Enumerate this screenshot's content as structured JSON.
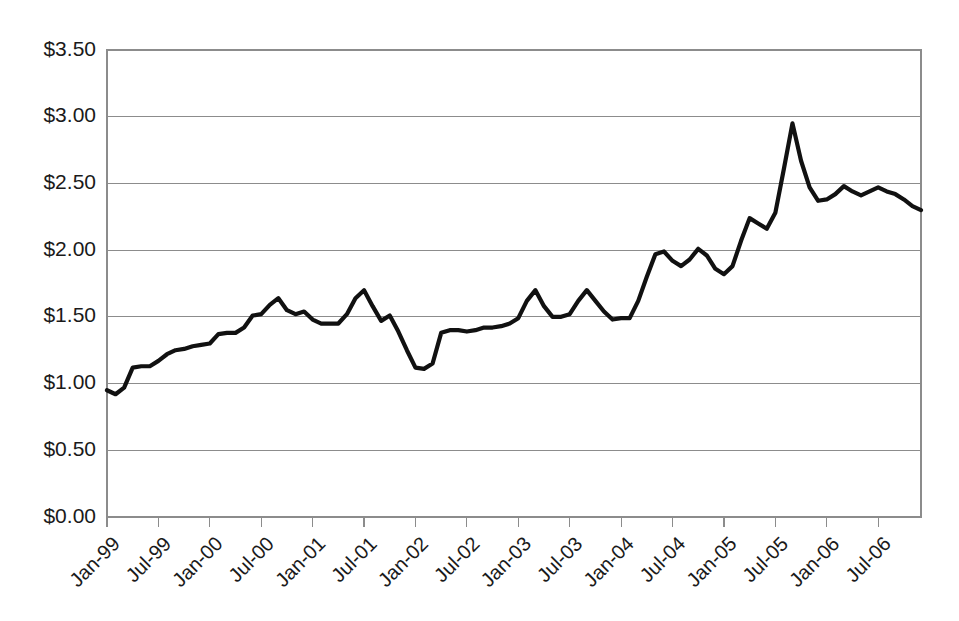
{
  "chart_data": {
    "type": "line",
    "title": "",
    "subtitle": "",
    "xlabel": "",
    "ylabel": "",
    "grid": true,
    "legend": false,
    "legend_position": "none",
    "line_color": "#111111",
    "grid_color": "#8c8c8c",
    "background_color": "#ffffff",
    "ylim": [
      0,
      3.5
    ],
    "y_tick_step": 0.5,
    "y_tick_labels": [
      "$0.00",
      "$0.50",
      "$1.00",
      "$1.50",
      "$2.00",
      "$2.50",
      "$3.00",
      "$3.50"
    ],
    "y_tick_values": [
      0,
      0.5,
      1.0,
      1.5,
      2.0,
      2.5,
      3.0,
      3.5
    ],
    "x_tick_labels": [
      "Jan-99",
      "Jul-99",
      "Jan-00",
      "Jul-00",
      "Jan-01",
      "Jul-01",
      "Jan-02",
      "Jul-02",
      "Jan-03",
      "Jul-03",
      "Jan-04",
      "Jul-04",
      "Jan-05",
      "Jul-05",
      "Jan-06",
      "Jul-06"
    ],
    "x_tick_interval_months": 6,
    "x_start": "Jan-99",
    "x_end": "Dec-06",
    "series": [
      {
        "name": "Price",
        "x": [
          "Jan-99",
          "Feb-99",
          "Mar-99",
          "Apr-99",
          "May-99",
          "Jun-99",
          "Jul-99",
          "Aug-99",
          "Sep-99",
          "Oct-99",
          "Nov-99",
          "Dec-99",
          "Jan-00",
          "Feb-00",
          "Mar-00",
          "Apr-00",
          "May-00",
          "Jun-00",
          "Jul-00",
          "Aug-00",
          "Sep-00",
          "Oct-00",
          "Nov-00",
          "Dec-00",
          "Jan-01",
          "Feb-01",
          "Mar-01",
          "Apr-01",
          "May-01",
          "Jun-01",
          "Jul-01",
          "Aug-01",
          "Sep-01",
          "Oct-01",
          "Nov-01",
          "Dec-01",
          "Jan-02",
          "Feb-02",
          "Mar-02",
          "Apr-02",
          "May-02",
          "Jun-02",
          "Jul-02",
          "Aug-02",
          "Sep-02",
          "Oct-02",
          "Nov-02",
          "Dec-02",
          "Jan-03",
          "Feb-03",
          "Mar-03",
          "Apr-03",
          "May-03",
          "Jun-03",
          "Jul-03",
          "Aug-03",
          "Sep-03",
          "Oct-03",
          "Nov-03",
          "Dec-03",
          "Jan-04",
          "Feb-04",
          "Mar-04",
          "Apr-04",
          "May-04",
          "Jun-04",
          "Jul-04",
          "Aug-04",
          "Sep-04",
          "Oct-04",
          "Nov-04",
          "Dec-04",
          "Jan-05",
          "Feb-05",
          "Mar-05",
          "Apr-05",
          "May-05",
          "Jun-05",
          "Jul-05",
          "Aug-05",
          "Sep-05",
          "Oct-05",
          "Nov-05",
          "Dec-05",
          "Jan-06",
          "Feb-06",
          "Mar-06",
          "Apr-06",
          "May-06",
          "Jun-06",
          "Jul-06",
          "Aug-06",
          "Sep-06",
          "Oct-06",
          "Nov-06",
          "Dec-06"
        ],
        "values": [
          0.95,
          0.92,
          0.97,
          1.12,
          1.13,
          1.13,
          1.17,
          1.22,
          1.25,
          1.26,
          1.28,
          1.29,
          1.3,
          1.37,
          1.38,
          1.38,
          1.42,
          1.51,
          1.52,
          1.59,
          1.64,
          1.55,
          1.52,
          1.54,
          1.48,
          1.45,
          1.45,
          1.45,
          1.52,
          1.64,
          1.7,
          1.58,
          1.47,
          1.51,
          1.39,
          1.25,
          1.12,
          1.11,
          1.15,
          1.38,
          1.4,
          1.4,
          1.39,
          1.4,
          1.42,
          1.42,
          1.43,
          1.45,
          1.49,
          1.62,
          1.7,
          1.58,
          1.5,
          1.5,
          1.52,
          1.62,
          1.7,
          1.62,
          1.54,
          1.48,
          1.49,
          1.49,
          1.62,
          1.8,
          1.97,
          1.99,
          1.92,
          1.88,
          1.93,
          2.01,
          1.96,
          1.86,
          1.82,
          1.88,
          2.07,
          2.24,
          2.2,
          2.16,
          2.28,
          2.61,
          2.95,
          2.67,
          2.47,
          2.37,
          2.38,
          2.42,
          2.48,
          2.44,
          2.41,
          2.44,
          2.47,
          2.44,
          2.42,
          2.38,
          2.33,
          2.3
        ]
      }
    ]
  },
  "axes": {
    "y_axis_name": "price-axis",
    "x_axis_name": "date-axis"
  }
}
